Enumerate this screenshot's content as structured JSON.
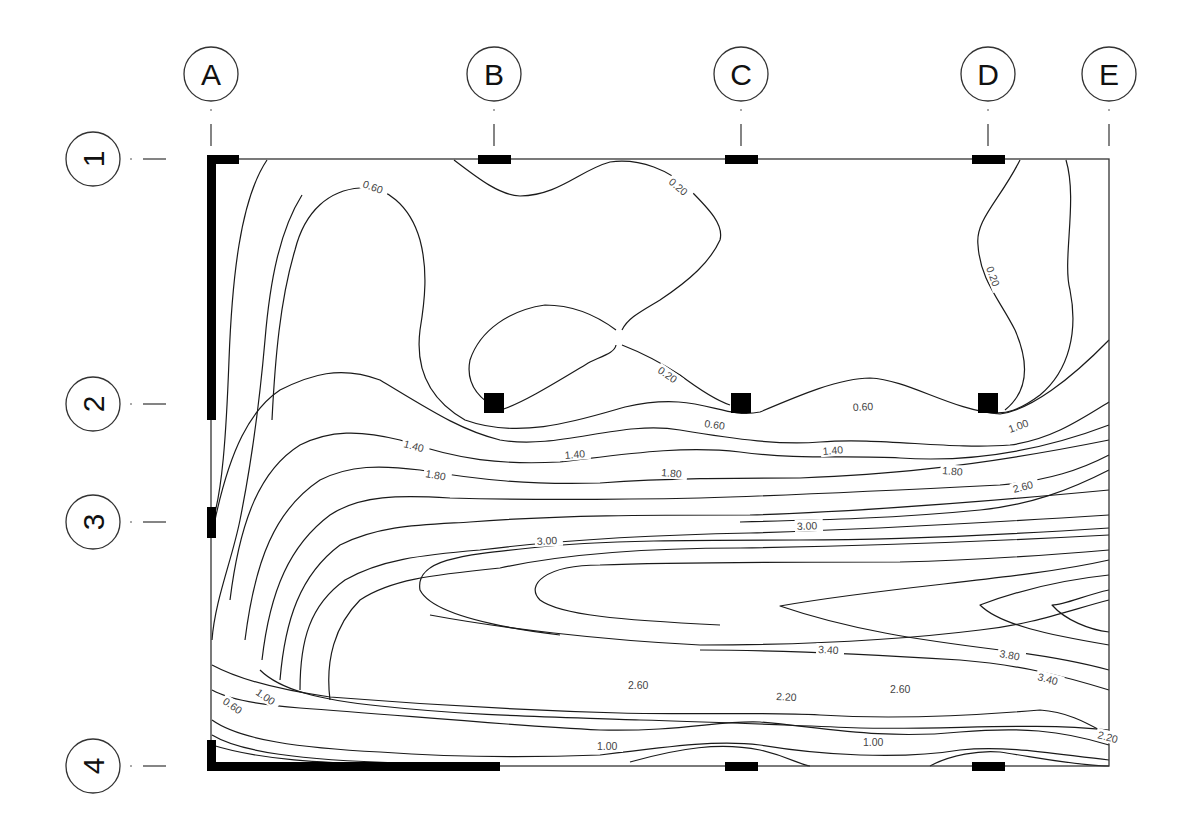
{
  "diagram": {
    "type": "structural-slab-contour-plot",
    "column_grid": [
      {
        "label": "A",
        "x": 211
      },
      {
        "label": "B",
        "x": 494
      },
      {
        "label": "C",
        "x": 741
      },
      {
        "label": "D",
        "x": 988
      },
      {
        "label": "E",
        "x": 1109
      }
    ],
    "row_grid": [
      {
        "label": "1",
        "y": 159
      },
      {
        "label": "2",
        "y": 404
      },
      {
        "label": "3",
        "y": 522
      },
      {
        "label": "4",
        "y": 766
      }
    ],
    "slab": {
      "x": 211,
      "y": 159,
      "width": 898,
      "height": 607
    },
    "contour_levels": [
      "0.20",
      "0.60",
      "1.00",
      "1.40",
      "1.80",
      "2.20",
      "2.60",
      "3.00",
      "3.40",
      "3.80"
    ],
    "contour_labels": [
      {
        "text": "0.60",
        "x": 362,
        "y": 187,
        "rot": 20
      },
      {
        "text": "0.20",
        "x": 668,
        "y": 183,
        "rot": 40
      },
      {
        "text": "0.20",
        "x": 986,
        "y": 268,
        "rot": 70
      },
      {
        "text": "0.20",
        "x": 657,
        "y": 372,
        "rot": 35
      },
      {
        "text": "0.60",
        "x": 704,
        "y": 427,
        "rot": 8
      },
      {
        "text": "0.60",
        "x": 853,
        "y": 411,
        "rot": -3
      },
      {
        "text": "1.00",
        "x": 1010,
        "y": 433,
        "rot": -20
      },
      {
        "text": "1.40",
        "x": 403,
        "y": 447,
        "rot": 15
      },
      {
        "text": "1.40",
        "x": 565,
        "y": 459,
        "rot": -5
      },
      {
        "text": "1.40",
        "x": 823,
        "y": 455,
        "rot": -5
      },
      {
        "text": "1.80",
        "x": 425,
        "y": 477,
        "rot": 10
      },
      {
        "text": "1.80",
        "x": 661,
        "y": 476,
        "rot": 5
      },
      {
        "text": "1.80",
        "x": 942,
        "y": 474,
        "rot": 5
      },
      {
        "text": "2.60",
        "x": 1014,
        "y": 493,
        "rot": -15
      },
      {
        "text": "3.00",
        "x": 537,
        "y": 545,
        "rot": -3
      },
      {
        "text": "3.00",
        "x": 797,
        "y": 530,
        "rot": -2
      },
      {
        "text": "3.40",
        "x": 818,
        "y": 653,
        "rot": 3
      },
      {
        "text": "3.80",
        "x": 999,
        "y": 657,
        "rot": 10
      },
      {
        "text": "3.40",
        "x": 1037,
        "y": 680,
        "rot": 15
      },
      {
        "text": "2.60",
        "x": 628,
        "y": 689,
        "rot": 0
      },
      {
        "text": "2.60",
        "x": 890,
        "y": 693,
        "rot": 0
      },
      {
        "text": "2.20",
        "x": 776,
        "y": 700,
        "rot": 3
      },
      {
        "text": "1.00",
        "x": 255,
        "y": 694,
        "rot": 35
      },
      {
        "text": "0.60",
        "x": 222,
        "y": 703,
        "rot": 35
      },
      {
        "text": "1.00",
        "x": 597,
        "y": 750,
        "rot": 0
      },
      {
        "text": "1.00",
        "x": 863,
        "y": 746,
        "rot": 0
      },
      {
        "text": "2.20",
        "x": 1097,
        "y": 738,
        "rot": 15
      }
    ],
    "contours": [
      "M 267 160 C 240 200, 232 280, 229 360 C 226 440, 222 490, 213 520",
      "M 302 195 C 280 230, 270 280, 265 340 C 258 420, 250 470, 240 520 C 232 560, 215 600, 212 640",
      "M 360 188 C 330 190, 305 210, 295 250 C 280 300, 275 360, 272 420",
      "M 360 188 C 385 185, 410 205, 420 240 C 428 270, 425 300, 420 330 C 415 370, 430 400, 465 420 C 520 440, 580 420, 625 407 C 700 390, 720 420, 760 412 C 800 395, 840 378, 870 378 C 910 380, 950 410, 1000 414 C 1030 410, 1070 380, 1109 340",
      "M 454 160 C 480 180, 500 195, 520 196 C 560 195, 580 170, 610 162 C 640 158, 670 170, 690 190 C 710 210, 724 225, 720 240 C 710 262, 690 280, 660 300 C 640 312, 628 318, 622 330",
      "M 616 330 C 600 318, 575 305, 545 305 C 510 310, 480 330, 470 360 C 465 385, 480 400, 500 410 C 520 405, 560 380, 590 362 C 605 355, 615 352, 616 345",
      "M 622 345 C 640 352, 660 362, 680 375 C 700 390, 715 400, 730 405",
      "M 1066 160 C 1078 200, 1062 260, 1070 290 C 1078 330, 1070 370, 1040 395 C 1020 410, 1005 415, 990 412",
      "M 1020 160 C 1000 200, 975 220, 978 245 C 980 280, 1000 300, 1015 330 C 1028 360, 1030 390, 1005 410",
      "M 215 520 C 230 450, 250 410, 280 390 C 310 375, 340 365, 380 380 C 430 410, 460 430, 500 440 C 560 450, 620 420, 680 430 C 740 440, 780 445, 820 442 C 880 437, 950 450, 1010 445 C 1050 440, 1080 420, 1109 402",
      "M 230 600 C 240 520, 260 470, 300 445 C 330 430, 360 430, 400 440 C 460 460, 500 465, 560 462 C 620 455, 680 445, 740 452 C 800 460, 850 455, 900 458 C 960 462, 1030 455, 1109 425",
      "M 245 640 C 255 560, 275 510, 320 480 C 350 465, 380 465, 420 470 C 480 480, 530 485, 600 483 C 670 478, 730 478, 800 478 C 870 475, 960 470, 1109 440",
      "M 262 660 C 270 590, 290 545, 330 515 C 360 495, 400 495, 450 498 C 520 500, 600 500, 700 498 C 800 495, 900 490, 1000 485 C 1050 480, 1080 470, 1109 455",
      "M 280 680 C 285 620, 300 575, 340 545 C 380 525, 420 525, 470 522 C 560 515, 650 515, 750 515 C 850 512, 950 505, 1109 490",
      "M 300 690 C 300 640, 310 605, 345 580 C 380 560, 420 555, 480 550 C 560 540, 650 535, 750 533 C 850 530, 950 525, 1109 515",
      "M 330 700 C 325 660, 335 625, 360 600 C 390 580, 430 575, 500 568 C 560 555, 640 548, 740 548 C 860 546, 980 542, 1109 535",
      "M 560 635 C 480 625, 430 610, 420 590 C 415 560, 460 555, 530 548 C 600 540, 700 540, 800 540 C 900 540, 1000 535, 1109 528",
      "M 720 625 C 620 620, 560 615, 540 600 C 525 585, 545 565, 600 565 C 680 562, 780 562, 900 562 C 980 560, 1050 555, 1109 550",
      "M 1109 560 C 1020 580, 900 585, 780 606 C 850 630, 920 640, 1000 650 C 1040 655, 1080 662, 1109 670",
      "M 1109 575 C 1060 580, 1020 590, 980 605 C 1000 625, 1050 635, 1109 645",
      "M 1109 590 C 1085 595, 1065 605, 1052 605 C 1065 620, 1090 630, 1109 632",
      "M 212 690 C 230 700, 260 705, 300 708 C 400 715, 500 725, 600 730 C 680 732, 720 720, 760 722 C 820 727, 880 740, 960 732 C 1020 727, 1060 730, 1109 745",
      "M 212 665 C 240 680, 280 690, 330 697 C 430 705, 520 710, 620 713 C 700 715, 760 712, 820 715 C 900 720, 980 715, 1040 710 C 1070 712, 1090 725, 1109 735",
      "M 212 720 C 240 740, 300 748, 380 752 C 450 757, 520 758, 600 755 C 680 745, 720 740, 760 745 C 820 755, 900 760, 960 750 C 1010 745, 1060 755, 1109 760",
      "M 212 745 C 260 760, 320 763, 400 765",
      "M 212 735 C 240 752, 300 760, 400 763 C 450 764, 480 765, 500 766",
      "M 630 762 C 680 748, 720 742, 760 750 C 790 757, 800 765, 810 766",
      "M 930 766 C 950 755, 980 750, 1000 752 C 1040 758, 1080 766, 1109 766",
      "M 260 670 C 280 690, 320 700, 380 706 C 470 716, 560 717, 640 720 C 720 722, 780 725, 860 728 C 950 730, 1030 722, 1109 730",
      "M 1109 470 C 1070 490, 1030 505, 980 510 C 900 518, 820 520, 740 522",
      "M 1109 600 C 1070 610, 1030 625, 980 630 C 900 640, 800 645, 700 645 C 600 640, 500 628, 430 615",
      "M 1109 690 C 1060 675, 1020 665, 960 660 C 880 655, 780 650, 700 650"
    ],
    "columns": [
      {
        "x": 484,
        "y": 393,
        "w": 20,
        "h": 20
      },
      {
        "x": 731,
        "y": 393,
        "w": 20,
        "h": 20
      },
      {
        "x": 978,
        "y": 393,
        "w": 20,
        "h": 20
      },
      {
        "x": 478,
        "y": 155,
        "w": 33,
        "h": 9
      },
      {
        "x": 725,
        "y": 155,
        "w": 33,
        "h": 9
      },
      {
        "x": 972,
        "y": 155,
        "w": 33,
        "h": 9
      },
      {
        "x": 725,
        "y": 762,
        "w": 33,
        "h": 9
      },
      {
        "x": 972,
        "y": 762,
        "w": 33,
        "h": 9
      },
      {
        "x": 207,
        "y": 507,
        "w": 9,
        "h": 31
      }
    ],
    "walls": [
      {
        "x": 207,
        "y": 155,
        "w": 9,
        "h": 265
      },
      {
        "x": 207,
        "y": 155,
        "w": 32,
        "h": 9
      },
      {
        "x": 207,
        "y": 762,
        "w": 293,
        "h": 9
      },
      {
        "x": 207,
        "y": 740,
        "w": 9,
        "h": 31
      }
    ]
  }
}
